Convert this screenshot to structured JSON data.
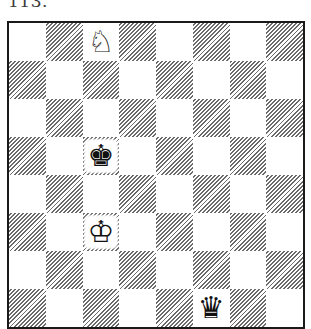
{
  "diagram": {
    "label": "113.",
    "board": {
      "orientation": "white-bottom",
      "files": [
        "a",
        "b",
        "c",
        "d",
        "e",
        "f",
        "g",
        "h"
      ],
      "ranks": [
        8,
        7,
        6,
        5,
        4,
        3,
        2,
        1
      ],
      "light_color": "#ffffff",
      "dark_style": "diagonal-hatch",
      "pieces": [
        {
          "square": "c8",
          "piece": "knight",
          "color": "white",
          "glyph": "♘"
        },
        {
          "square": "c5",
          "piece": "king",
          "color": "black",
          "glyph": "♚"
        },
        {
          "square": "c3",
          "piece": "king",
          "color": "white",
          "glyph": "♔"
        },
        {
          "square": "f1",
          "piece": "queen",
          "color": "black",
          "glyph": "♛"
        }
      ]
    }
  }
}
